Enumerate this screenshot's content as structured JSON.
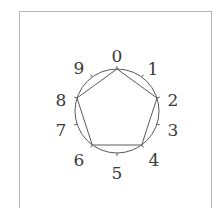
{
  "diagram": {
    "type": "clock-circle-with-inscribed-pentagon",
    "center": [
      117,
      111
    ],
    "radius": 42,
    "stroke_color": "#5a5a5a",
    "label_color": "#3a3a3a",
    "positions": [
      "0",
      "1",
      "2",
      "3",
      "4",
      "5",
      "6",
      "7",
      "8",
      "9"
    ],
    "polygon_vertices": [
      "0",
      "2",
      "4",
      "6",
      "8"
    ],
    "polygon_edges": [
      [
        "0",
        "2"
      ],
      [
        "2",
        "4"
      ],
      [
        "4",
        "6"
      ],
      [
        "6",
        "8"
      ],
      [
        "8",
        "0"
      ]
    ]
  },
  "labels": {
    "p0": "0",
    "p1": "1",
    "p2": "2",
    "p3": "3",
    "p4": "4",
    "p5": "5",
    "p6": "6",
    "p7": "7",
    "p8": "8",
    "p9": "9"
  }
}
